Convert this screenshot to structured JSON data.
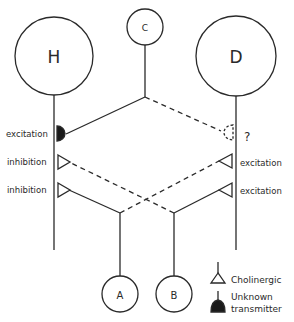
{
  "diagram": {
    "type": "neural circuit",
    "nodes": {
      "H": {
        "label": "H",
        "cx": 54,
        "cy": 56,
        "r": 39
      },
      "D": {
        "label": "D",
        "cx": 236,
        "cy": 56,
        "r": 40
      },
      "C": {
        "label": "C",
        "cx": 145,
        "cy": 27,
        "r": 18
      },
      "A": {
        "label": "A",
        "cx": 120,
        "cy": 294,
        "r": 18
      },
      "B": {
        "label": "B",
        "cx": 174,
        "cy": 294,
        "r": 18
      }
    },
    "synapse_labels": {
      "h_top": "excitation",
      "h_mid": "inhibition",
      "h_bot": "inhibition",
      "d_top": "?",
      "d_mid": "excitation",
      "d_bot": "excitation"
    },
    "connections": [
      {
        "from": "C",
        "to": "H",
        "type": "unknown transmitter",
        "effect": "excitation",
        "style": "solid"
      },
      {
        "from": "C",
        "to": "D",
        "type": "unknown transmitter",
        "effect": "?",
        "style": "dashed"
      },
      {
        "from": "B",
        "to": "H",
        "type": "cholinergic",
        "effect": "inhibition",
        "style": "dashed"
      },
      {
        "from": "A",
        "to": "H",
        "type": "cholinergic",
        "effect": "inhibition",
        "style": "solid"
      },
      {
        "from": "A",
        "to": "D",
        "type": "cholinergic",
        "effect": "excitation",
        "style": "dashed"
      },
      {
        "from": "B",
        "to": "D",
        "type": "cholinergic",
        "effect": "excitation",
        "style": "solid"
      }
    ],
    "legend": {
      "cholinergic": "Cholinergic",
      "unknown_line1": "Unknown",
      "unknown_line2": "transmitter"
    },
    "colors": {
      "stroke": "#2a2a2a",
      "background": "#ffffff"
    }
  }
}
